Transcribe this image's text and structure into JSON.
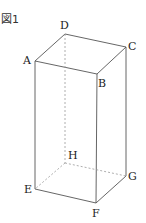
{
  "figure": {
    "title": "図1",
    "shape": "rectangular prism",
    "vertices": {
      "A": {
        "label": "A",
        "x": 35,
        "y": 61
      },
      "B": {
        "label": "B",
        "x": 97,
        "y": 74
      },
      "C": {
        "label": "C",
        "x": 126,
        "y": 47
      },
      "D": {
        "label": "D",
        "x": 65,
        "y": 34
      },
      "E": {
        "label": "E",
        "x": 35,
        "y": 189
      },
      "F": {
        "label": "F",
        "x": 96,
        "y": 203
      },
      "G": {
        "label": "G",
        "x": 126,
        "y": 176
      },
      "H": {
        "label": "H",
        "x": 65,
        "y": 163
      }
    },
    "solid_edges": [
      "AB",
      "BC",
      "CD",
      "DA",
      "AE",
      "BF",
      "CG",
      "EF",
      "FG"
    ],
    "hidden_edges": [
      "DH",
      "HE",
      "HG"
    ],
    "colors": {
      "line": "#444444",
      "hidden": "#888888",
      "text": "#222222"
    }
  }
}
